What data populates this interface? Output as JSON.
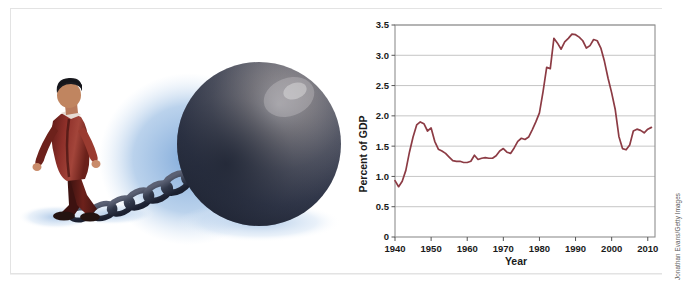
{
  "figure": {
    "illustration": {
      "name": "ball-and-chain-illustration",
      "description": "Businessman in red suit dragging a giant iron ball and chain",
      "colors": {
        "suit": "#8d2f29",
        "suit_shadow": "#4a1510",
        "hair": "#1b1b20",
        "ball_dark": "#2a2f3f",
        "ball_mid": "#4a4a52",
        "ball_light": "#8c8a8e",
        "chain": "#2d3345",
        "cast_shadow": "#7fa8d8",
        "floor_shadow": "#a8c4e4"
      }
    },
    "credit": "Jonathan Evans/Getty Images"
  },
  "chart_data": {
    "type": "line",
    "title": "",
    "subtitle": "",
    "xlabel": "Year",
    "ylabel": "Percent of GDP",
    "xlim": [
      1940,
      2012
    ],
    "ylim": [
      0,
      3.5
    ],
    "grid": "horizontal",
    "legend": "none",
    "line_color": "#8c3b44",
    "x_ticks": [
      1940,
      1950,
      1960,
      1970,
      1980,
      1990,
      2000,
      2010
    ],
    "x_tick_labels": [
      "1940",
      "1950",
      "1960",
      "1970",
      "1980",
      "1990",
      "2000",
      "2010"
    ],
    "y_ticks": [
      0,
      0.5,
      1.0,
      1.5,
      2.0,
      2.5,
      3.0,
      3.5
    ],
    "y_tick_labels": [
      "0",
      "0.5",
      "1.0",
      "1.5",
      "2.0",
      "2.5",
      "3.0",
      "3.5"
    ],
    "series": [
      {
        "name": "Net interest outlays as percent of GDP",
        "x": [
          1940,
          1941,
          1942,
          1943,
          1944,
          1945,
          1946,
          1947,
          1948,
          1949,
          1950,
          1951,
          1952,
          1953,
          1954,
          1955,
          1956,
          1957,
          1958,
          1959,
          1960,
          1961,
          1962,
          1963,
          1964,
          1965,
          1966,
          1967,
          1968,
          1969,
          1970,
          1971,
          1972,
          1973,
          1974,
          1975,
          1976,
          1977,
          1978,
          1979,
          1980,
          1981,
          1982,
          1983,
          1984,
          1985,
          1986,
          1987,
          1988,
          1989,
          1990,
          1991,
          1992,
          1993,
          1994,
          1995,
          1996,
          1997,
          1998,
          1999,
          2000,
          2001,
          2002,
          2003,
          2004,
          2005,
          2006,
          2007,
          2008,
          2009,
          2010,
          2011
        ],
        "y": [
          0.93,
          0.83,
          0.92,
          1.1,
          1.4,
          1.65,
          1.85,
          1.9,
          1.87,
          1.75,
          1.8,
          1.58,
          1.45,
          1.42,
          1.38,
          1.32,
          1.26,
          1.25,
          1.25,
          1.23,
          1.23,
          1.25,
          1.35,
          1.28,
          1.3,
          1.31,
          1.3,
          1.3,
          1.34,
          1.42,
          1.46,
          1.4,
          1.38,
          1.47,
          1.58,
          1.63,
          1.61,
          1.65,
          1.77,
          1.9,
          2.05,
          2.4,
          2.8,
          2.78,
          3.28,
          3.2,
          3.1,
          3.22,
          3.28,
          3.35,
          3.34,
          3.3,
          3.24,
          3.12,
          3.16,
          3.26,
          3.24,
          3.12,
          2.9,
          2.62,
          2.38,
          2.1,
          1.66,
          1.46,
          1.44,
          1.52,
          1.75,
          1.78,
          1.76,
          1.72,
          1.78,
          1.81
        ],
        "color": "#8c3b44",
        "width": 1.7
      }
    ]
  }
}
